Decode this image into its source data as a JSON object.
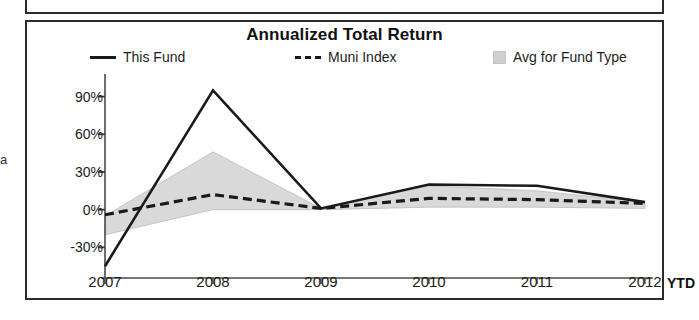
{
  "margin_glyph": "a",
  "chart": {
    "title": "Annualized Total Return",
    "axis_suffix_label": "YTD",
    "legend": [
      {
        "label": "This Fund",
        "marker": "solid-line-swatch"
      },
      {
        "label": "Muni Index",
        "marker": "dashed-line-swatch"
      },
      {
        "label": "Avg for Fund Type",
        "marker": "gray-box-swatch"
      }
    ]
  },
  "chart_data": {
    "type": "line",
    "title": "Annualized Total Return",
    "xlabel": "",
    "ylabel": "",
    "x": [
      "2007",
      "2008",
      "2009",
      "2010",
      "2011",
      "2012"
    ],
    "categories": [
      "2007",
      "2008",
      "2009",
      "2010",
      "2011",
      "2012"
    ],
    "ytick_labels": [
      "90%",
      "60%",
      "30%",
      "0%",
      "-30%"
    ],
    "ytick_values": [
      90,
      60,
      30,
      0,
      -30
    ],
    "ylim": [
      -48,
      100
    ],
    "grid": false,
    "legend_position": "top",
    "annotations": [
      "YTD"
    ],
    "series": [
      {
        "name": "This Fund",
        "style": "solid",
        "color": "#1a1a1a",
        "values": [
          -45,
          95,
          1,
          20,
          19,
          6
        ]
      },
      {
        "name": "Muni Index",
        "style": "dashed",
        "color": "#1a1a1a",
        "values": [
          -4,
          12,
          1,
          9,
          8,
          5
        ]
      },
      {
        "name": "Avg for Fund Type",
        "style": "band",
        "color": "#d9d9d9",
        "upper": [
          -5,
          46,
          1,
          19,
          15,
          6
        ],
        "lower": [
          -20,
          0,
          0,
          2,
          2,
          1
        ]
      }
    ]
  }
}
